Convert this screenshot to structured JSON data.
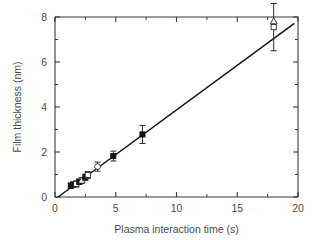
{
  "figure": {
    "background_color": "#ffffff",
    "line_color": "#111111",
    "axis_color": "#3a3a3a",
    "text_color": "#4a4a4a"
  },
  "chart_data": {
    "type": "scatter",
    "title": "",
    "xlabel": "Plasma interaction time (s)",
    "ylabel": "Film thickness (nm)",
    "xlim": [
      0,
      20
    ],
    "ylim": [
      0,
      8
    ],
    "xticks": [
      0,
      5,
      10,
      15,
      20
    ],
    "yticks": [
      0,
      2,
      4,
      6,
      8
    ],
    "xtick_labels": [
      "0",
      "5",
      "10",
      "15",
      "20"
    ],
    "ytick_labels": [
      "0",
      "2",
      "4",
      "6",
      "8"
    ],
    "xminor_ticks": [
      2.5,
      7.5,
      12.5,
      17.5
    ],
    "yminor_ticks": [
      1,
      3,
      5,
      7
    ],
    "grid": false,
    "legend": "none",
    "series": [
      {
        "name": "Film thickness vs plasma interaction time",
        "marker": "mixed",
        "points": [
          {
            "x": 1.3,
            "y": 0.5,
            "yerr": 0.12,
            "marker": "filled-square"
          },
          {
            "x": 1.5,
            "y": 0.55,
            "yerr": 0.12,
            "marker": "filled-square"
          },
          {
            "x": 1.75,
            "y": 0.58,
            "yerr": 0.14,
            "marker": "open-square"
          },
          {
            "x": 2.0,
            "y": 0.68,
            "yerr": 0.12,
            "marker": "filled-square"
          },
          {
            "x": 2.2,
            "y": 0.74,
            "yerr": 0.13,
            "marker": "open-triangle"
          },
          {
            "x": 2.5,
            "y": 0.88,
            "yerr": 0.14,
            "marker": "filled-square"
          },
          {
            "x": 2.7,
            "y": 0.98,
            "yerr": 0.15,
            "marker": "open-square"
          },
          {
            "x": 3.5,
            "y": 1.35,
            "yerr": 0.2,
            "marker": "open-circle"
          },
          {
            "x": 4.8,
            "y": 1.82,
            "yerr": 0.22,
            "marker": "filled-square"
          },
          {
            "x": 7.2,
            "y": 2.78,
            "yerr": 0.4,
            "marker": "filled-square"
          },
          {
            "x": 18.0,
            "y": 7.55,
            "yerr": 1.05,
            "marker": "open-square"
          },
          {
            "x": 18.0,
            "y": 7.82,
            "yerr": 0.0,
            "marker": "open-triangle"
          }
        ]
      }
    ],
    "fit_line": {
      "description": "linear fit through data",
      "x_start": 0.25,
      "y_start": 0.0,
      "x_end": 19.7,
      "y_end": 7.72,
      "slope": 0.397,
      "intercept": -0.099
    }
  }
}
